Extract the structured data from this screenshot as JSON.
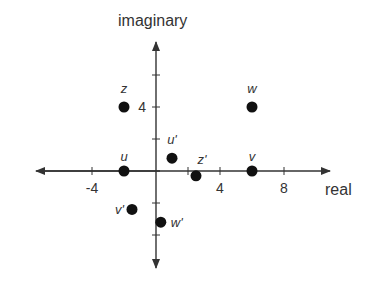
{
  "diagram": {
    "type": "complex-plane",
    "axis_labels": {
      "x": "real",
      "y": "imaginary"
    },
    "x_ticks": [
      {
        "value": -4,
        "label": "-4"
      },
      {
        "value": 4,
        "label": "4"
      },
      {
        "value": 8,
        "label": "8"
      }
    ],
    "y_ticks": [
      {
        "value": 4,
        "label": "4"
      }
    ],
    "points": [
      {
        "name": "Z",
        "label": "z",
        "x": -2,
        "y": 4
      },
      {
        "name": "W",
        "label": "w",
        "x": 6,
        "y": 4
      },
      {
        "name": "U",
        "label": "u",
        "x": -2,
        "y": 0
      },
      {
        "name": "V",
        "label": "v",
        "x": 6,
        "y": 0
      },
      {
        "name": "U'",
        "label": "u'",
        "x": 1,
        "y": 0.8
      },
      {
        "name": "Z'",
        "label": "z'",
        "x": 2.5,
        "y": -0.3
      },
      {
        "name": "V'",
        "label": "v'",
        "x": -1.5,
        "y": -2.4
      },
      {
        "name": "W'",
        "label": "w'",
        "x": 0.3,
        "y": -3.2
      }
    ]
  },
  "colors": {
    "axis": "#333333",
    "point": "#111111",
    "text": "#333333"
  }
}
